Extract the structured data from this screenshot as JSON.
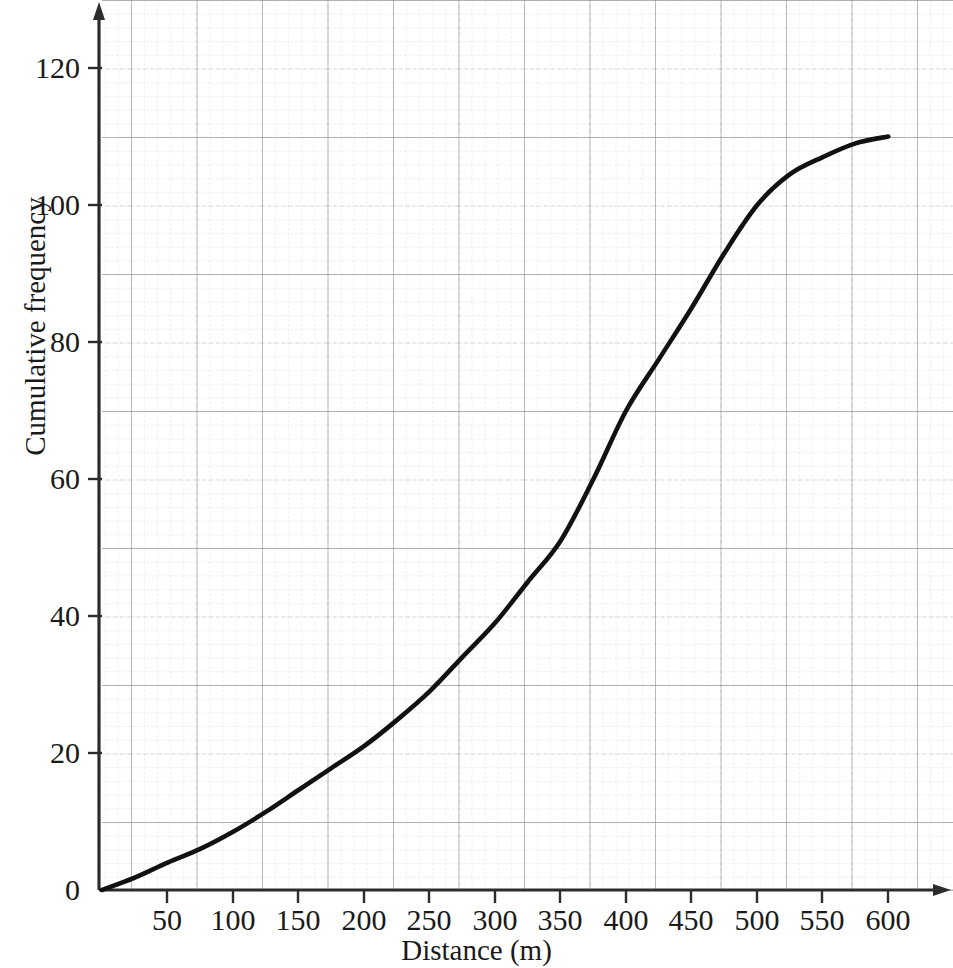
{
  "chart_data": {
    "type": "line",
    "title": "",
    "subtitle": "",
    "xlabel": "Distance (m)",
    "ylabel": "Cumulative frequency",
    "grid": true,
    "legend": "none",
    "xlim": [
      0,
      630
    ],
    "ylim": [
      0,
      128
    ],
    "x_tick_labels": [
      "0",
      "50",
      "100",
      "150",
      "200",
      "250",
      "300",
      "350",
      "400",
      "450",
      "500",
      "550",
      "600"
    ],
    "x_ticks": [
      0,
      50,
      100,
      150,
      200,
      250,
      300,
      350,
      400,
      450,
      500,
      550,
      600
    ],
    "y_tick_labels": [
      "0",
      "20",
      "40",
      "60",
      "80",
      "100",
      "120"
    ],
    "y_ticks": [
      0,
      20,
      40,
      60,
      80,
      100,
      120
    ],
    "x_minor_step": 10,
    "y_minor_step": 2,
    "series": [
      {
        "name": "Cumulative frequency",
        "color": "#111111",
        "x": [
          0,
          25,
          50,
          75,
          100,
          125,
          150,
          175,
          200,
          225,
          250,
          275,
          300,
          325,
          350,
          375,
          400,
          425,
          450,
          475,
          500,
          525,
          550,
          575,
          600
        ],
        "values": [
          0,
          1.8,
          4,
          6,
          8.5,
          11.4,
          14.6,
          17.8,
          21,
          24.8,
          29,
          34,
          39,
          45,
          51,
          60,
          70,
          77.5,
          85,
          93,
          100,
          104.5,
          107,
          109,
          110
        ]
      }
    ],
    "key_points": [
      {
        "x": 0,
        "y": 0
      },
      {
        "x": 50,
        "y": 4
      },
      {
        "x": 100,
        "y": 8.5
      },
      {
        "x": 150,
        "y": 14.6
      },
      {
        "x": 200,
        "y": 21
      },
      {
        "x": 250,
        "y": 29
      },
      {
        "x": 300,
        "y": 39
      },
      {
        "x": 350,
        "y": 51
      },
      {
        "x": 400,
        "y": 70
      },
      {
        "x": 450,
        "y": 85
      },
      {
        "x": 500,
        "y": 100
      },
      {
        "x": 550,
        "y": 107
      },
      {
        "x": 600,
        "y": 110
      }
    ],
    "max_cumulative_frequency": 110,
    "colors": {
      "curve": "#111111",
      "axis": "#3a3a3a",
      "major_grid": "#a8a8a8",
      "minor_grid": "#c9c9c9",
      "fine_grid": "#d8d8d8",
      "background": "#ffffff",
      "text": "#1a1a1a"
    }
  }
}
